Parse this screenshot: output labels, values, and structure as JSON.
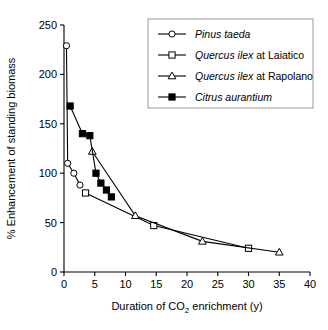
{
  "figure": {
    "background": "#ffffff",
    "ink_color": "#000000",
    "legend_border_color": "#9a9a9a"
  },
  "chart_data": {
    "type": "line",
    "title": "",
    "subtitle": "",
    "xlabel_parts": {
      "pre": "Duration of CO",
      "sub": "2",
      "post": " enrichment (y)"
    },
    "xlabel": "Duration of CO2 enrichment (y)",
    "ylabel": "% Enhancement of standing biomass",
    "xlim": [
      0,
      40
    ],
    "ylim": [
      0,
      250
    ],
    "xticks": [
      0,
      5,
      10,
      15,
      20,
      25,
      30,
      35,
      40
    ],
    "yticks": [
      0,
      50,
      100,
      150,
      200,
      250
    ],
    "xtick_labels": [
      "0",
      "5",
      "10",
      "15",
      "20",
      "25",
      "30",
      "35",
      "40"
    ],
    "ytick_labels": [
      "0",
      "50",
      "100",
      "150",
      "200",
      "250"
    ],
    "grid": false,
    "legend_position": "top-right",
    "series": [
      {
        "name": "Pinus taeda",
        "name_italic": "Pinus taeda",
        "name_roman": "",
        "marker": "circle-open",
        "x": [
          0.4,
          0.6,
          1.6,
          2.6
        ],
        "y": [
          229,
          110,
          100,
          88
        ]
      },
      {
        "name": "Quercus ilex at Laiatico",
        "name_italic": "Quercus ilex",
        "name_roman": " at Laiatico",
        "marker": "square-open",
        "x": [
          3.5,
          14.6,
          30.0
        ],
        "y": [
          80,
          47,
          24
        ]
      },
      {
        "name": "Quercus ilex at Rapolano",
        "name_italic": "Quercus ilex",
        "name_roman": " at Rapolano",
        "marker": "triangle-open",
        "x": [
          4.6,
          11.6,
          22.5,
          35.0
        ],
        "y": [
          122,
          57,
          31,
          20
        ]
      },
      {
        "name": "Citrus aurantium",
        "name_italic": "Citrus aurantium",
        "name_roman": "",
        "marker": "square-filled",
        "x": [
          1.0,
          3.0,
          4.2,
          5.2,
          6.0,
          6.9,
          7.7
        ],
        "y": [
          168,
          140,
          138,
          100,
          90,
          83,
          76
        ]
      }
    ]
  }
}
